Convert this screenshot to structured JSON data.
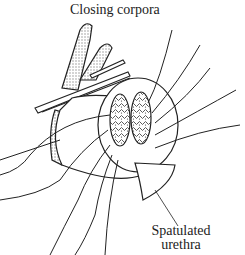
{
  "figure": {
    "labels": {
      "top": "Closing corpora",
      "bottom_line1": "Spatulated",
      "bottom_line2": "urethra"
    },
    "colors": {
      "ink": "#222222",
      "stipple": "#c8c8c8",
      "background": "#ffffff"
    }
  }
}
